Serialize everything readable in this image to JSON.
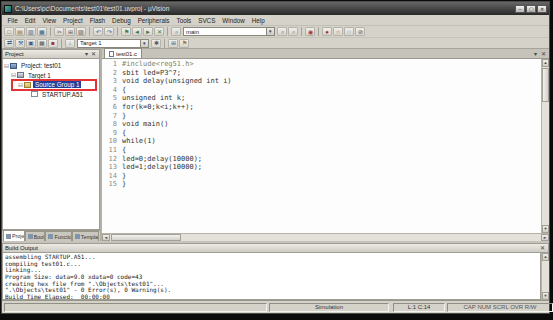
{
  "window": {
    "title": "C:\\Users\\pc\\Documents\\test01\\test01.uvproj - µVision",
    "controls": [
      {
        "n": "minimize-button",
        "g": "–"
      },
      {
        "n": "maximize-button",
        "g": "▢"
      },
      {
        "n": "close-button",
        "g": "✕"
      }
    ]
  },
  "menu_items": [
    "File",
    "Edit",
    "View",
    "Project",
    "Flash",
    "Debug",
    "Peripherals",
    "Tools",
    "SVCS",
    "Window",
    "Help"
  ],
  "toolbar_row1": {
    "search_value": "main",
    "icons_left": [
      {
        "n": "new-file-icon",
        "g": "□",
        "c": "gray"
      },
      {
        "n": "open-file-icon",
        "g": "▤",
        "c": "amber"
      },
      {
        "n": "save-icon",
        "g": "▥",
        "c": "blue"
      },
      {
        "n": "save-all-icon",
        "g": "▦",
        "c": "blue"
      },
      {
        "n": "separator",
        "t": "sep"
      },
      {
        "n": "cut-icon",
        "g": "✂",
        "c": "gray"
      },
      {
        "n": "copy-icon",
        "g": "⊞",
        "c": "gray"
      },
      {
        "n": "paste-icon",
        "g": "▨",
        "c": "gray"
      },
      {
        "n": "separator",
        "t": "sep"
      },
      {
        "n": "undo-icon",
        "g": "↶",
        "c": "blue"
      },
      {
        "n": "redo-icon",
        "g": "↷",
        "c": "blue"
      },
      {
        "n": "separator",
        "t": "sep"
      },
      {
        "n": "bookmark-icon",
        "g": "⚑",
        "c": "green"
      },
      {
        "n": "prev-bookmark-icon",
        "g": "◄",
        "c": "green"
      },
      {
        "n": "next-bookmark-icon",
        "g": "►",
        "c": "green"
      },
      {
        "n": "clear-bookmarks-icon",
        "g": "✕",
        "c": "green"
      },
      {
        "n": "separator",
        "t": "sep"
      },
      {
        "n": "find-in-files-icon",
        "g": "⌕",
        "c": "gray"
      }
    ],
    "icons_right": [
      {
        "n": "find-icon",
        "g": "⌕",
        "c": "blue"
      },
      {
        "n": "incremental-find-icon",
        "g": "⌕",
        "c": "gray"
      },
      {
        "n": "separator",
        "t": "sep"
      },
      {
        "n": "start-debug-icon",
        "g": "◉",
        "c": "red"
      },
      {
        "n": "separator",
        "t": "sep"
      },
      {
        "n": "insert-breakpoint-icon",
        "g": "●",
        "c": "red"
      },
      {
        "n": "enable-breakpoint-icon",
        "g": "○",
        "c": "red"
      },
      {
        "n": "disable-breakpoints-icon",
        "g": "◌",
        "c": "gray"
      },
      {
        "n": "kill-breakpoints-icon",
        "g": "⊘",
        "c": "gray"
      }
    ]
  },
  "toolbar_row2": {
    "target_value": "Target 1",
    "icons_left": [
      {
        "n": "translate-icon",
        "g": "⇄",
        "c": "blue"
      },
      {
        "n": "build-icon",
        "g": "⚒",
        "c": "blue"
      },
      {
        "n": "rebuild-icon",
        "g": "▣",
        "c": "blue"
      },
      {
        "n": "batch-build-icon",
        "g": "▦",
        "c": "gray"
      },
      {
        "n": "stop-build-icon",
        "g": "■",
        "c": "red"
      },
      {
        "n": "separator",
        "t": "sep"
      },
      {
        "n": "download-icon",
        "g": "↓",
        "c": "green"
      }
    ],
    "icons_right": [
      {
        "n": "options-for-target-icon",
        "g": "✱",
        "c": "gray"
      },
      {
        "n": "separator",
        "t": "sep"
      },
      {
        "n": "manage-project-items-icon",
        "g": "⊞",
        "c": "blue"
      },
      {
        "n": "flag-icon",
        "g": "⚑",
        "c": "amber"
      }
    ]
  },
  "project_panel": {
    "title": "Project",
    "header_icons": {
      "dropdown": "▾",
      "close": "✕"
    },
    "tree": [
      {
        "label": "Project: test01",
        "level": 0,
        "expander": "⊟",
        "icon": "project",
        "selected": false,
        "annotated": false
      },
      {
        "label": "Target 1",
        "level": 1,
        "expander": "⊟",
        "icon": "target",
        "selected": false,
        "annotated": false
      },
      {
        "label": "Source Group 1",
        "level": 2,
        "expander": "⊟",
        "icon": "folder",
        "selected": true,
        "annotated": true
      },
      {
        "label": "STARTUP.A51",
        "level": 3,
        "expander": "",
        "icon": "file",
        "selected": false,
        "annotated": false
      }
    ],
    "tabs": [
      {
        "name": "panel-tab-project",
        "label": "Project",
        "active": true
      },
      {
        "name": "panel-tab-books",
        "label": "Books",
        "active": false
      },
      {
        "name": "panel-tab-functions",
        "label": "Functions",
        "active": false
      },
      {
        "name": "panel-tab-templates",
        "label": "Templates",
        "active": false
      }
    ]
  },
  "editor": {
    "tab_label": "test01.c",
    "lines": [
      {
        "no": "1",
        "code": "#include<reg51.h>",
        "cls": "inc"
      },
      {
        "no": "2",
        "code": "sbit led=P3^7;"
      },
      {
        "no": "3",
        "code": "void delay(unsigned int i)"
      },
      {
        "no": "4",
        "code": "{"
      },
      {
        "no": "5",
        "code": "unsigned int k;"
      },
      {
        "no": "6",
        "code": "for(k=0;k<i;k++);"
      },
      {
        "no": "7",
        "code": "}"
      },
      {
        "no": "8",
        "code": "void main()"
      },
      {
        "no": "9",
        "code": "{"
      },
      {
        "no": "10",
        "code": "while(1)"
      },
      {
        "no": "11",
        "code": "{"
      },
      {
        "no": "12",
        "code": "led=0;delay(10000);"
      },
      {
        "no": "13",
        "code": "led=1;delay(10000);"
      },
      {
        "no": "14",
        "code": "}"
      },
      {
        "no": "15",
        "code": "}"
      }
    ]
  },
  "build_output": {
    "title": "Build Output",
    "lines": [
      "assembling STARTUP.A51...",
      "compiling test01.c...",
      "linking...",
      "Program Size: data=9.0 xdata=0 code=43",
      "creating hex file from \".\\Objects\\test01\"...",
      "\".\\Objects\\test01\" - 0 Error(s), 0 Warning(s).",
      "Build Time Elapsed:  00:00:00"
    ]
  },
  "status_bar": {
    "left": "",
    "mode": "Simulation",
    "cursor_position": "L:1 C:14",
    "flags": "CAP NUM SCRL OVR R/W"
  },
  "ui": {
    "dropdown_arrow": "▾",
    "scroll_up": "▲",
    "scroll_down": "▼",
    "scroll_left": "◄",
    "scroll_right": "►",
    "close": "✕",
    "accent_selection": "#21419b",
    "annotation_red": "#e23434"
  }
}
